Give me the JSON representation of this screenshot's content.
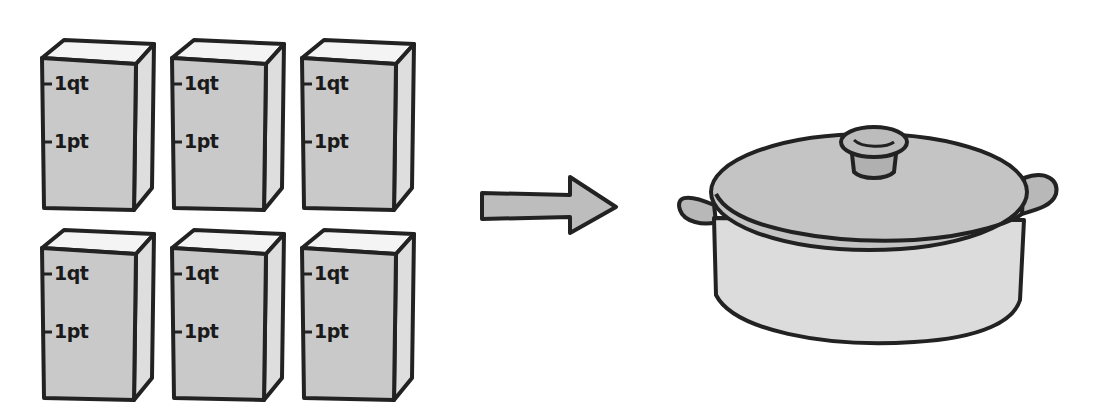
{
  "diagram": {
    "cartons": [
      {
        "quart_label": "1qt",
        "pint_label": "1pt"
      },
      {
        "quart_label": "1qt",
        "pint_label": "1pt"
      },
      {
        "quart_label": "1qt",
        "pint_label": "1pt"
      },
      {
        "quart_label": "1qt",
        "pint_label": "1pt"
      },
      {
        "quart_label": "1qt",
        "pint_label": "1pt"
      },
      {
        "quart_label": "1qt",
        "pint_label": "1pt"
      }
    ],
    "arrow": "right-arrow",
    "target": "cooking-pot",
    "colors": {
      "outline": "#222222",
      "carton_front": "#c9c9c9",
      "carton_side": "#dedede",
      "carton_top": "#f4f4f4",
      "pot_lid": "#c4c4c4",
      "pot_body": "#dcdcdc",
      "arrow_fill": "#bdbdbd"
    }
  }
}
